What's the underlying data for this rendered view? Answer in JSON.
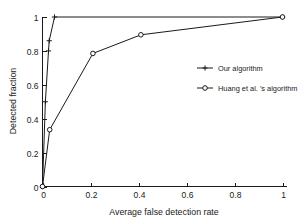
{
  "chart_data": {
    "type": "line",
    "title": "",
    "xlabel": "Average false detection rate",
    "ylabel": "Detected fraction",
    "xlim": [
      0,
      1.05
    ],
    "ylim": [
      0,
      1.05
    ],
    "grid": false,
    "legend_position": "right-middle",
    "xticks": [
      "0",
      "0.2",
      "0.4",
      "0.6",
      "0.8",
      "1"
    ],
    "xtick_values": [
      0,
      0.2,
      0.4,
      0.6,
      0.8,
      1
    ],
    "yticks": [
      "0",
      "0.2",
      "0.4",
      "0.6",
      "0.8",
      "1"
    ],
    "ytick_values": [
      0,
      0.2,
      0.4,
      0.6,
      0.8,
      1
    ],
    "series": [
      {
        "name": "Our algorithm",
        "marker": "plus",
        "color": "#1a1a1a",
        "x": [
          0,
          0.012,
          0.025,
          0.05,
          0.2,
          0.41,
          1.0
        ],
        "y": [
          0,
          0.5,
          0.8,
          0.86,
          1.0,
          1.0,
          1.0
        ],
        "points": [
          {
            "x": 0,
            "y": 0
          },
          {
            "x": 0.012,
            "y": 0.5
          },
          {
            "x": 0.025,
            "y": 0.8
          },
          {
            "x": 0.028,
            "y": 0.86
          },
          {
            "x": 0.05,
            "y": 1.0
          },
          {
            "x": 1.0,
            "y": 1.0
          }
        ]
      },
      {
        "name": "Huang et al. 's algorithm",
        "marker": "circle",
        "color": "#1a1a1a",
        "x": [
          0,
          0.03,
          0.21,
          0.41,
          1.0
        ],
        "y": [
          0,
          0.335,
          0.785,
          0.895,
          1.0
        ],
        "points": [
          {
            "x": 0,
            "y": 0
          },
          {
            "x": 0.03,
            "y": 0.335
          },
          {
            "x": 0.21,
            "y": 0.785
          },
          {
            "x": 0.41,
            "y": 0.895
          },
          {
            "x": 1.0,
            "y": 1.0
          }
        ]
      }
    ],
    "legend": [
      {
        "label": "Our algorithm",
        "marker": "plus"
      },
      {
        "label": "Huang et al. 's algorithm",
        "marker": "circle"
      }
    ]
  }
}
